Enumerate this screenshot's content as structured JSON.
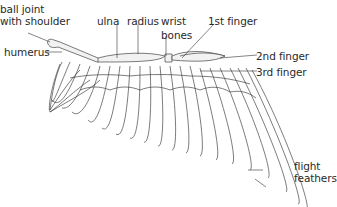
{
  "diagram": {
    "labels": [
      {
        "id": "ball-joint",
        "line1": "ball joint",
        "line2": "with shoulder"
      },
      {
        "id": "humerus",
        "line1": "humerus"
      },
      {
        "id": "ulna",
        "line1": "ulna"
      },
      {
        "id": "radius",
        "line1": "radius"
      },
      {
        "id": "wrist-bones",
        "line1": "wrist",
        "line2": "bones"
      },
      {
        "id": "first-finger",
        "line1": "1st finger"
      },
      {
        "id": "second-finger",
        "line1": "2nd finger"
      },
      {
        "id": "third-finger",
        "line1": "3rd finger"
      },
      {
        "id": "flight-feathers",
        "line1": "flight",
        "line2": "feathers"
      }
    ],
    "colors": {
      "line": "#3a3a3a",
      "text": "#2a2a2a",
      "background": "#ffffff",
      "bone_fill": "#f2f2f2"
    }
  }
}
